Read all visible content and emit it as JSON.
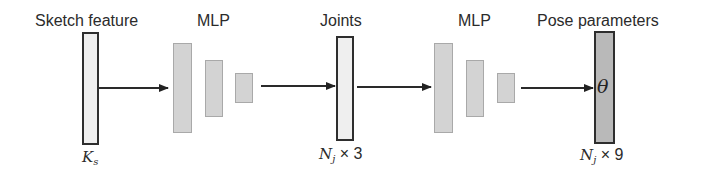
{
  "diagram": {
    "nodes": [
      {
        "id": "sketch_feature",
        "label": "Sketch feature",
        "dim_main": "K",
        "dim_sub": "s",
        "dim_suffix": "",
        "style": "light"
      },
      {
        "id": "mlp1",
        "label": "MLP",
        "layers": 3
      },
      {
        "id": "joints",
        "label": "Joints",
        "dim_main": "N",
        "dim_sub": "j",
        "dim_suffix": " × 3",
        "style": "light"
      },
      {
        "id": "mlp2",
        "label": "MLP",
        "layers": 3
      },
      {
        "id": "pose_parameters",
        "label": "Pose parameters",
        "symbol": "θ",
        "dim_main": "N",
        "dim_sub": "j",
        "dim_suffix": " × 9",
        "style": "dark"
      }
    ],
    "edges": [
      {
        "from": "sketch_feature",
        "to": "mlp1"
      },
      {
        "from": "mlp1",
        "to": "joints"
      },
      {
        "from": "joints",
        "to": "mlp2"
      },
      {
        "from": "mlp2",
        "to": "pose_parameters"
      }
    ],
    "colors": {
      "vector_light": "#efefef",
      "vector_dark": "#b9b9b9",
      "layer_fill": "#d3d3d3",
      "stroke": "#2e2e2e"
    }
  }
}
